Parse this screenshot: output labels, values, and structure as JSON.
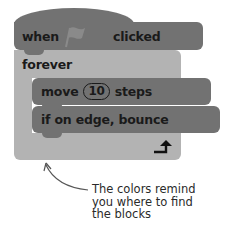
{
  "blocks": {
    "hat": {
      "word1": "when",
      "icon": "green-flag-icon",
      "word2": "clicked",
      "color": "#727272"
    },
    "forever": {
      "label": "forever",
      "color": "#b3b3b3",
      "loop_icon": "loop-arrow-icon"
    },
    "move": {
      "word1": "move",
      "value": "10",
      "word2": "steps",
      "color": "#727272"
    },
    "bounce": {
      "label": "if on edge, bounce",
      "color": "#727272"
    }
  },
  "caption": {
    "line1": "The colors remind",
    "line2": "you where to find",
    "line3": "the blocks"
  }
}
